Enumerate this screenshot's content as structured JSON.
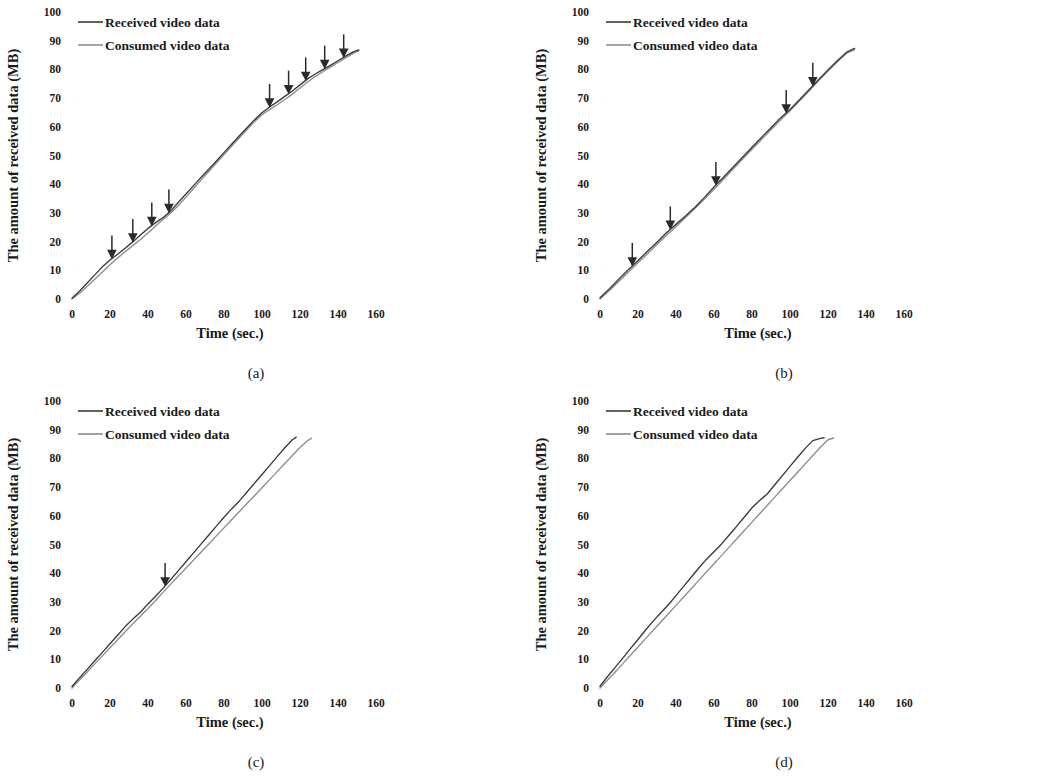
{
  "figure": {
    "panels": [
      {
        "id": "a",
        "caption": "(a)",
        "y_axis_title": "The amount of received data (MB)",
        "x_axis_title": "Time (sec.)",
        "y_ticks": [
          "0",
          "10",
          "20",
          "30",
          "40",
          "50",
          "60",
          "70",
          "80",
          "90",
          "100"
        ],
        "x_ticks": [
          "0",
          "20",
          "40",
          "60",
          "80",
          "100",
          "120",
          "140",
          "160"
        ],
        "legend": [
          {
            "label": "Received video data",
            "color": "#3a3a3a"
          },
          {
            "label": "Consumed video data",
            "color": "#8d8d8d"
          }
        ]
      },
      {
        "id": "b",
        "caption": "(b)",
        "y_axis_title": "The amount of received data (MB)",
        "x_axis_title": "Time (sec.)",
        "y_ticks": [
          "0",
          "10",
          "20",
          "30",
          "40",
          "50",
          "60",
          "70",
          "80",
          "90",
          "100"
        ],
        "x_ticks": [
          "0",
          "20",
          "40",
          "60",
          "80",
          "100",
          "120",
          "140",
          "160"
        ],
        "legend": [
          {
            "label": "Received video data",
            "color": "#3a3a3a"
          },
          {
            "label": "Consumed video data",
            "color": "#8d8d8d"
          }
        ]
      },
      {
        "id": "c",
        "caption": "(c)",
        "y_axis_title": "The amount of received data (MB)",
        "x_axis_title": "Time (sec.)",
        "y_ticks": [
          "0",
          "10",
          "20",
          "30",
          "40",
          "50",
          "60",
          "70",
          "80",
          "90",
          "100"
        ],
        "x_ticks": [
          "0",
          "20",
          "40",
          "60",
          "80",
          "100",
          "120",
          "140",
          "160"
        ],
        "legend": [
          {
            "label": "Received video data",
            "color": "#3a3a3a"
          },
          {
            "label": "Consumed video data",
            "color": "#8d8d8d"
          }
        ]
      },
      {
        "id": "d",
        "caption": "(d)",
        "y_axis_title": "The amount of received data (MB)",
        "x_axis_title": "Time (sec.)",
        "y_ticks": [
          "0",
          "10",
          "20",
          "30",
          "40",
          "50",
          "60",
          "70",
          "80",
          "90",
          "100"
        ],
        "x_ticks": [
          "0",
          "20",
          "40",
          "60",
          "80",
          "100",
          "120",
          "140",
          "160"
        ],
        "legend": [
          {
            "label": "Received video data",
            "color": "#3a3a3a"
          },
          {
            "label": "Consumed video data",
            "color": "#8d8d8d"
          }
        ]
      }
    ]
  },
  "chart_data": [
    {
      "panel": "a",
      "type": "line",
      "title": "(a)",
      "xlabel": "Time (sec.)",
      "ylabel": "The amount of received data (MB)",
      "xlim": [
        0,
        160
      ],
      "ylim": [
        0,
        100
      ],
      "xticks": [
        0,
        20,
        40,
        60,
        80,
        100,
        120,
        140,
        160
      ],
      "yticks": [
        0,
        10,
        20,
        30,
        40,
        50,
        60,
        70,
        80,
        90,
        100
      ],
      "grid": false,
      "legend_position": "top-left",
      "annotations": {
        "type": "down-arrow",
        "description": "Downward arrows marking rebuffering / quality-switch events",
        "x_positions": [
          21,
          32,
          42,
          51,
          104,
          114,
          123,
          133,
          143
        ]
      },
      "series": [
        {
          "name": "Received video data",
          "color": "#3a3a3a",
          "x": [
            0,
            4,
            8,
            12,
            16,
            20,
            24,
            28,
            32,
            36,
            40,
            44,
            48,
            52,
            56,
            60,
            64,
            68,
            72,
            76,
            80,
            84,
            88,
            92,
            96,
            100,
            104,
            108,
            112,
            116,
            120,
            124,
            128,
            132,
            136,
            140,
            144,
            148,
            151
          ],
          "y": [
            0.3,
            2.8,
            5.6,
            8.4,
            11.2,
            13.6,
            15.6,
            17.7,
            19.9,
            22.3,
            24.6,
            26.6,
            28.4,
            30.7,
            33.7,
            36.6,
            39.5,
            42.4,
            45.2,
            48.1,
            51.0,
            53.9,
            56.8,
            59.6,
            62.4,
            64.9,
            66.9,
            68.7,
            70.6,
            72.5,
            74.6,
            76.7,
            78.4,
            79.9,
            81.4,
            83.0,
            84.6,
            86.1,
            86.8
          ]
        },
        {
          "name": "Consumed video data",
          "color": "#8d8d8d",
          "x": [
            0,
            4,
            8,
            12,
            16,
            20,
            24,
            28,
            32,
            36,
            40,
            44,
            48,
            52,
            56,
            60,
            64,
            68,
            72,
            76,
            80,
            84,
            88,
            92,
            96,
            100,
            104,
            108,
            112,
            116,
            120,
            124,
            128,
            132,
            136,
            140,
            144,
            148,
            151
          ],
          "y": [
            0.0,
            2.0,
            4.4,
            6.9,
            9.4,
            11.9,
            14.3,
            16.5,
            18.6,
            20.7,
            23.0,
            25.4,
            27.8,
            30.0,
            32.6,
            35.5,
            38.5,
            41.5,
            44.4,
            47.4,
            50.3,
            53.2,
            56.1,
            59.0,
            61.8,
            64.2,
            66.0,
            67.7,
            69.5,
            71.4,
            73.5,
            75.6,
            77.5,
            79.2,
            80.8,
            82.4,
            84.0,
            85.6,
            86.5
          ]
        }
      ]
    },
    {
      "panel": "b",
      "type": "line",
      "title": "(b)",
      "xlabel": "Time (sec.)",
      "ylabel": "The amount of received data (MB)",
      "xlim": [
        0,
        160
      ],
      "ylim": [
        0,
        100
      ],
      "xticks": [
        0,
        20,
        40,
        60,
        80,
        100,
        120,
        140,
        160
      ],
      "yticks": [
        0,
        10,
        20,
        30,
        40,
        50,
        60,
        70,
        80,
        90,
        100
      ],
      "grid": false,
      "legend_position": "top-left",
      "annotations": {
        "type": "down-arrow",
        "description": "Downward arrows marking rebuffering / quality-switch events",
        "x_positions": [
          17,
          37,
          61,
          98,
          112
        ]
      },
      "series": [
        {
          "name": "Received video data",
          "color": "#3a3a3a",
          "x": [
            0,
            5,
            10,
            15,
            20,
            25,
            30,
            35,
            40,
            45,
            50,
            55,
            60,
            65,
            70,
            75,
            80,
            85,
            90,
            95,
            100,
            105,
            110,
            115,
            120,
            125,
            130,
            134
          ],
          "y": [
            0.4,
            3.6,
            7.0,
            10.3,
            13.4,
            16.6,
            19.8,
            23.1,
            26.0,
            28.9,
            32.0,
            35.4,
            39.0,
            42.4,
            45.9,
            49.4,
            52.9,
            56.3,
            59.7,
            63.1,
            66.0,
            69.4,
            72.9,
            76.4,
            79.8,
            83.1,
            86.1,
            87.3
          ]
        },
        {
          "name": "Consumed video data",
          "color": "#8d8d8d",
          "x": [
            0,
            5,
            10,
            15,
            20,
            25,
            30,
            35,
            40,
            45,
            50,
            55,
            60,
            65,
            70,
            75,
            80,
            85,
            90,
            95,
            100,
            105,
            110,
            115,
            120,
            125,
            130,
            134
          ],
          "y": [
            0.0,
            3.0,
            6.2,
            9.4,
            12.6,
            15.8,
            19.0,
            22.2,
            25.2,
            28.4,
            31.6,
            34.8,
            38.2,
            41.7,
            45.2,
            48.7,
            52.2,
            55.6,
            59.0,
            62.4,
            65.6,
            69.0,
            72.5,
            76.0,
            79.4,
            82.7,
            85.7,
            86.9
          ]
        }
      ]
    },
    {
      "panel": "c",
      "type": "line",
      "title": "(c)",
      "xlabel": "Time (sec.)",
      "ylabel": "The amount of received data (MB)",
      "xlim": [
        0,
        160
      ],
      "ylim": [
        0,
        100
      ],
      "xticks": [
        0,
        20,
        40,
        60,
        80,
        100,
        120,
        140,
        160
      ],
      "yticks": [
        0,
        10,
        20,
        30,
        40,
        50,
        60,
        70,
        80,
        90,
        100
      ],
      "grid": false,
      "legend_position": "top-left",
      "annotations": {
        "type": "down-arrow",
        "description": "Downward arrow marking a rebuffering / quality-switch event",
        "x_positions": [
          49
        ]
      },
      "series": [
        {
          "name": "Received video data",
          "color": "#3a3a3a",
          "x": [
            0,
            4,
            8,
            12,
            16,
            20,
            24,
            28,
            32,
            36,
            40,
            44,
            48,
            52,
            56,
            60,
            64,
            68,
            72,
            76,
            80,
            84,
            88,
            92,
            96,
            100,
            104,
            108,
            112,
            116,
            118
          ],
          "y": [
            0.5,
            3.6,
            6.5,
            9.5,
            12.4,
            15.4,
            18.4,
            21.4,
            24.0,
            26.4,
            29.3,
            32.0,
            34.8,
            37.8,
            40.9,
            44.0,
            47.1,
            50.2,
            53.3,
            56.4,
            59.5,
            62.4,
            65.1,
            68.2,
            71.3,
            74.4,
            77.5,
            80.6,
            83.7,
            86.5,
            87.4
          ]
        },
        {
          "name": "Consumed video data",
          "color": "#8d8d8d",
          "x": [
            0,
            4,
            8,
            12,
            16,
            20,
            24,
            28,
            32,
            36,
            40,
            44,
            48,
            52,
            56,
            60,
            64,
            68,
            72,
            76,
            80,
            84,
            88,
            92,
            96,
            100,
            104,
            108,
            112,
            116,
            120,
            124,
            126
          ],
          "y": [
            0.0,
            2.8,
            5.6,
            8.4,
            11.2,
            14.0,
            16.8,
            19.6,
            22.4,
            25.0,
            27.7,
            30.5,
            33.4,
            36.2,
            39.0,
            41.8,
            44.6,
            47.4,
            50.2,
            53.0,
            55.8,
            58.6,
            61.4,
            64.2,
            67.0,
            69.8,
            72.6,
            75.4,
            78.2,
            81.0,
            83.8,
            86.2,
            87.0
          ]
        }
      ]
    },
    {
      "panel": "d",
      "type": "line",
      "title": "(d)",
      "xlabel": "Time (sec.)",
      "ylabel": "The amount of received data (MB)",
      "xlim": [
        0,
        160
      ],
      "ylim": [
        0,
        100
      ],
      "xticks": [
        0,
        20,
        40,
        60,
        80,
        100,
        120,
        140,
        160
      ],
      "yticks": [
        0,
        10,
        20,
        30,
        40,
        50,
        60,
        70,
        80,
        90,
        100
      ],
      "grid": false,
      "legend_position": "top-left",
      "annotations": {
        "type": "none",
        "description": "No event arrows in this panel",
        "x_positions": []
      },
      "series": [
        {
          "name": "Received video data",
          "color": "#3a3a3a",
          "x": [
            0,
            4,
            8,
            12,
            16,
            20,
            24,
            28,
            32,
            36,
            40,
            44,
            48,
            52,
            56,
            60,
            64,
            68,
            72,
            76,
            80,
            84,
            88,
            92,
            96,
            100,
            104,
            108,
            112,
            116,
            118
          ],
          "y": [
            0.6,
            4.0,
            7.2,
            10.4,
            13.7,
            16.9,
            20.2,
            23.3,
            26.2,
            29.0,
            32.2,
            35.4,
            38.6,
            41.8,
            44.8,
            47.5,
            50.2,
            53.3,
            56.4,
            59.6,
            62.8,
            65.3,
            67.6,
            70.8,
            74.0,
            77.2,
            80.4,
            83.5,
            86.2,
            87.0,
            87.2
          ]
        },
        {
          "name": "Consumed video data",
          "color": "#8d8d8d",
          "x": [
            0,
            4,
            8,
            12,
            16,
            20,
            24,
            28,
            32,
            36,
            40,
            44,
            48,
            52,
            56,
            60,
            64,
            68,
            72,
            76,
            80,
            84,
            88,
            92,
            96,
            100,
            104,
            108,
            112,
            116,
            120,
            123
          ],
          "y": [
            0.0,
            2.8,
            5.6,
            8.5,
            11.4,
            14.3,
            17.2,
            20.1,
            23.0,
            25.9,
            28.8,
            31.7,
            34.6,
            37.5,
            40.4,
            43.3,
            46.2,
            49.1,
            52.0,
            54.9,
            57.8,
            60.7,
            63.6,
            66.5,
            69.4,
            72.3,
            75.2,
            78.1,
            81.0,
            83.9,
            86.5,
            87.1
          ]
        }
      ]
    }
  ]
}
